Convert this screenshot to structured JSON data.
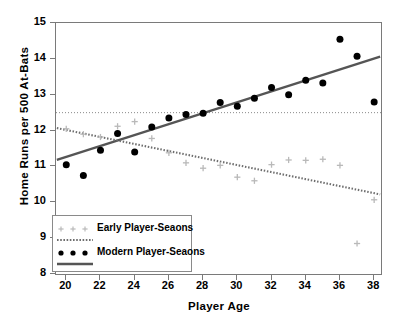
{
  "figure": {
    "caption_fragment": "",
    "background": "#ffffff"
  },
  "axes": {
    "xlabel": "Player  Age",
    "ylabel": "Home  Runs  per  500  At-Bats",
    "x_ticks": [
      20,
      22,
      24,
      26,
      28,
      30,
      32,
      34,
      36,
      38
    ],
    "y_ticks": [
      8,
      9,
      10,
      11,
      12,
      13,
      14,
      15
    ],
    "xlim": [
      19.4,
      38.4
    ],
    "ylim": [
      8,
      15
    ]
  },
  "legend": {
    "position": "bottom-left",
    "entries": [
      {
        "label": "Early Player-Seaons",
        "marker": "plus",
        "color": "#b9b9b9",
        "line_style": "dotted"
      },
      {
        "label": "Modern Player-Seaons",
        "marker": "circle",
        "color": "#000000",
        "line_style": "solid"
      }
    ]
  },
  "colors": {
    "modern": "#000000",
    "early": "#b9b9b9",
    "modern_fit": "#555555",
    "early_fit": "#6e6e6e",
    "reference_line": "#8a8a8a",
    "frame": "#7a7a7a"
  },
  "chart_data": {
    "type": "scatter",
    "title": "",
    "xlabel": "Player  Age",
    "ylabel": "Home  Runs  per  500  At-Bats",
    "xlim": [
      19.4,
      38.4
    ],
    "ylim": [
      8,
      15
    ],
    "grid": false,
    "legend_position": "bottom-left",
    "series": [
      {
        "name": "Modern Player-Seaons",
        "marker": "circle",
        "color": "#000000",
        "x": [
          20,
          21,
          22,
          23,
          24,
          25,
          26,
          27,
          28,
          29,
          30,
          31,
          32,
          33,
          34,
          35,
          36,
          37,
          38
        ],
        "y": [
          11.05,
          10.75,
          11.45,
          11.92,
          11.4,
          12.1,
          12.35,
          12.45,
          12.48,
          12.78,
          12.68,
          12.9,
          13.2,
          13.0,
          13.4,
          13.33,
          14.55,
          14.07,
          12.8
        ]
      },
      {
        "name": "Early Player-Seaons",
        "marker": "plus",
        "color": "#b9b9b9",
        "x": [
          20,
          21,
          22,
          23,
          24,
          25,
          26,
          27,
          28,
          29,
          30,
          31,
          32,
          33,
          34,
          35,
          36,
          37,
          38
        ],
        "y": [
          12.05,
          11.9,
          11.82,
          12.12,
          12.25,
          11.78,
          11.38,
          11.1,
          10.95,
          11.03,
          10.7,
          10.6,
          11.05,
          11.18,
          11.17,
          11.2,
          11.03,
          8.85,
          10.07
        ]
      }
    ],
    "fit_lines": [
      {
        "name": "Modern trend",
        "style": "solid",
        "color": "#555555",
        "x": [
          19.45,
          38.35
        ],
        "y": [
          11.18,
          14.06
        ]
      },
      {
        "name": "Early trend",
        "style": "dotted",
        "color": "#6e6e6e",
        "x": [
          19.45,
          38.35
        ],
        "y": [
          12.07,
          10.22
        ]
      }
    ],
    "reference_lines": [
      {
        "name": "horizontal reference",
        "orientation": "horizontal",
        "style": "dotted",
        "color": "#8a8a8a",
        "y": 12.5
      }
    ]
  }
}
